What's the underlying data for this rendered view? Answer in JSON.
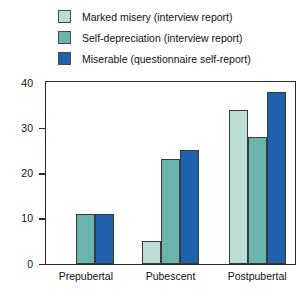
{
  "chart_data": {
    "type": "bar",
    "title": "",
    "subtitle": "",
    "xlabel": "",
    "ylabel": "",
    "categories": [
      "Prepubertal",
      "Pubescent",
      "Postpubertal"
    ],
    "series": [
      {
        "name": "Marked misery (interview report)",
        "color": "#bcdcd6",
        "values": [
          0,
          5,
          34
        ]
      },
      {
        "name": "Self-depreciation (interview report)",
        "color": "#69b4ab",
        "values": [
          11,
          23,
          28
        ]
      },
      {
        "name": "Miserable (questionnaire self-report)",
        "color": "#1f62ab",
        "values": [
          11,
          25,
          38
        ]
      }
    ],
    "ylim": [
      0,
      40
    ],
    "yticks": [
      0,
      10,
      20,
      30,
      40
    ],
    "ytick_labels": [
      "0",
      "10",
      "20",
      "30",
      "40"
    ],
    "grid": false,
    "legend_position": "top-left",
    "frame_color": "#2b2b2b",
    "bar_border_color": "#3a3a3a",
    "background": "#ffffff"
  }
}
